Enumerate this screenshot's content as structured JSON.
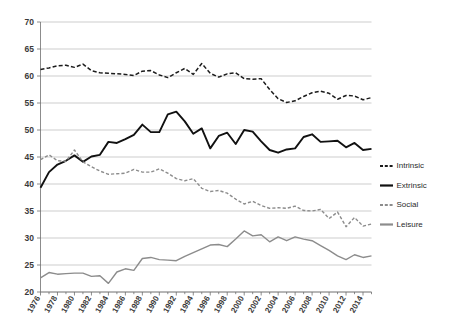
{
  "chart_data": {
    "type": "line",
    "title": "",
    "xlabel": "",
    "ylabel": "",
    "ylim": [
      20,
      70
    ],
    "ytick_step": 5,
    "grid": true,
    "legend_position": "right",
    "ytick_labels": [
      "20",
      "25",
      "30",
      "35",
      "40",
      "45",
      "50",
      "55",
      "60",
      "65",
      "70"
    ],
    "x": [
      1976,
      1977,
      1978,
      1979,
      1980,
      1981,
      1982,
      1983,
      1984,
      1985,
      1986,
      1987,
      1988,
      1989,
      1990,
      1991,
      1992,
      1993,
      1994,
      1995,
      1996,
      1997,
      1998,
      1999,
      2000,
      2001,
      2002,
      2003,
      2004,
      2005,
      2006,
      2007,
      2008,
      2009,
      2010,
      2011,
      2012,
      2013,
      2014,
      2015
    ],
    "xtick_labels": [
      "1976",
      "1978",
      "1980",
      "1982",
      "1984",
      "1986",
      "1988",
      "1990",
      "1992",
      "1994",
      "1996",
      "1998",
      "2000",
      "2002",
      "2004",
      "2006",
      "2008",
      "2010",
      "2012",
      "2014"
    ],
    "series": [
      {
        "name": "Intrinsic",
        "style": "dashed",
        "color": "#1c1c1c",
        "width": 1.5,
        "values": [
          61.2,
          61.5,
          61.9,
          62.0,
          61.6,
          62.2,
          61.0,
          60.6,
          60.5,
          60.4,
          60.3,
          60.1,
          60.9,
          61.0,
          60.2,
          59.7,
          60.6,
          61.4,
          60.3,
          62.3,
          60.5,
          59.8,
          60.4,
          60.6,
          59.5,
          59.4,
          59.5,
          57.5,
          55.8,
          55.1,
          55.4,
          56.2,
          56.9,
          57.2,
          56.8,
          55.7,
          56.4,
          56.3,
          55.6,
          56.0
        ]
      },
      {
        "name": "Extrinsic",
        "style": "solid",
        "color": "#111111",
        "width": 1.9,
        "values": [
          39.3,
          42.2,
          43.6,
          44.3,
          45.3,
          44.1,
          45.1,
          45.4,
          47.8,
          47.6,
          48.3,
          49.1,
          51.0,
          49.6,
          49.6,
          52.9,
          53.4,
          51.6,
          49.3,
          50.3,
          46.6,
          48.9,
          49.5,
          47.4,
          50.0,
          49.7,
          47.9,
          46.3,
          45.8,
          46.4,
          46.6,
          48.7,
          49.2,
          47.8,
          47.9,
          48.0,
          46.8,
          47.6,
          46.3,
          46.5
        ]
      },
      {
        "name": "Social",
        "style": "dashed",
        "color": "#8c8c8c",
        "width": 1.4,
        "values": [
          44.5,
          45.4,
          44.3,
          44.2,
          46.3,
          44.1,
          43.2,
          42.4,
          41.8,
          41.9,
          42.0,
          42.7,
          42.2,
          42.2,
          42.8,
          42.0,
          41.0,
          40.6,
          41.0,
          39.2,
          38.6,
          38.8,
          38.3,
          37.2,
          36.3,
          36.8,
          36.0,
          35.5,
          35.6,
          35.5,
          35.9,
          35.1,
          35.0,
          35.3,
          33.6,
          34.8,
          32.1,
          33.8,
          32.2,
          32.6
        ]
      },
      {
        "name": "Leisure",
        "style": "solid",
        "color": "#8c8c8c",
        "width": 1.4,
        "values": [
          22.6,
          23.6,
          23.3,
          23.4,
          23.5,
          23.5,
          22.9,
          23.0,
          21.6,
          23.7,
          24.3,
          24.0,
          26.2,
          26.4,
          26.0,
          25.9,
          25.8,
          26.6,
          27.3,
          28.0,
          28.7,
          28.8,
          28.4,
          29.8,
          31.3,
          30.4,
          30.6,
          29.3,
          30.2,
          29.5,
          30.2,
          29.8,
          29.5,
          28.6,
          27.7,
          26.7,
          26.0,
          26.9,
          26.4,
          26.7
        ]
      }
    ]
  },
  "legend": {
    "items": [
      {
        "label": "Intrinsic"
      },
      {
        "label": "Extrinsic"
      },
      {
        "label": "Social"
      },
      {
        "label": "Leisure"
      }
    ]
  }
}
